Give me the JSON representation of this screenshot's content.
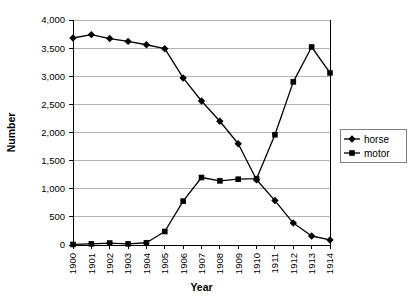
{
  "chart_data": {
    "type": "line",
    "title": "",
    "xlabel": "Year",
    "ylabel": "Number",
    "categories": [
      "1900",
      "1901",
      "1902",
      "1903",
      "1904",
      "1905",
      "1906",
      "1907",
      "1908",
      "1909",
      "1910",
      "1911",
      "1912",
      "1913",
      "1914"
    ],
    "xlim": [
      1900,
      1914
    ],
    "ylim": [
      0,
      4000
    ],
    "ytick_labels": [
      "0",
      "500",
      "1,000",
      "1,500",
      "2,000",
      "2,500",
      "3,000",
      "3,500",
      "4,000"
    ],
    "ytick_values": [
      0,
      500,
      1000,
      1500,
      2000,
      2500,
      3000,
      3500,
      4000
    ],
    "grid": "horizontal",
    "legend_position": "right",
    "series": [
      {
        "name": "horse",
        "marker": "diamond",
        "color": "#000000",
        "values": [
          3680,
          3740,
          3670,
          3620,
          3560,
          3490,
          2970,
          2560,
          2200,
          1800,
          1160,
          790,
          390,
          160,
          90
        ]
      },
      {
        "name": "motor",
        "marker": "square",
        "color": "#000000",
        "values": [
          10,
          20,
          35,
          20,
          40,
          240,
          780,
          1200,
          1140,
          1170,
          1180,
          1960,
          2900,
          3520,
          3060
        ]
      }
    ]
  },
  "legend": {
    "items": [
      {
        "label": "horse"
      },
      {
        "label": "motor"
      }
    ]
  },
  "axes": {
    "y_title": "Number",
    "x_title": "Year"
  }
}
